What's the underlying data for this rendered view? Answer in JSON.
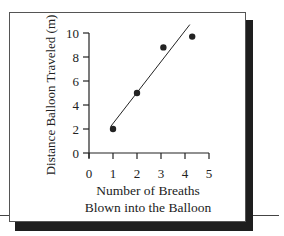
{
  "chart_data": {
    "type": "scatter",
    "title": "",
    "xlabel": "Number of Breaths Blown into the Balloon",
    "xlabel_lines": [
      "Number of Breaths",
      "Blown into the Balloon"
    ],
    "ylabel": "Distance Balloon Traveled (m)",
    "xlim": [
      0,
      5
    ],
    "ylim": [
      0,
      10
    ],
    "x_ticks": [
      "0",
      "1",
      "2",
      "3",
      "4",
      "5"
    ],
    "y_ticks": [
      "0",
      "2",
      "4",
      "6",
      "8",
      "10"
    ],
    "grid": false,
    "legend": null,
    "series": [
      {
        "name": "Measurements",
        "points": [
          {
            "x": 1.0,
            "y": 2.0
          },
          {
            "x": 2.0,
            "y": 5.0
          },
          {
            "x": 3.1,
            "y": 8.8
          },
          {
            "x": 4.3,
            "y": 9.7
          }
        ]
      }
    ],
    "trend_line": {
      "x1": 0.9,
      "y1": 2.2,
      "x2": 4.2,
      "y2": 10.7
    }
  },
  "colors": {
    "ink": "#222222",
    "shadow": "#1e1e1e",
    "panel": "#ffffff"
  }
}
